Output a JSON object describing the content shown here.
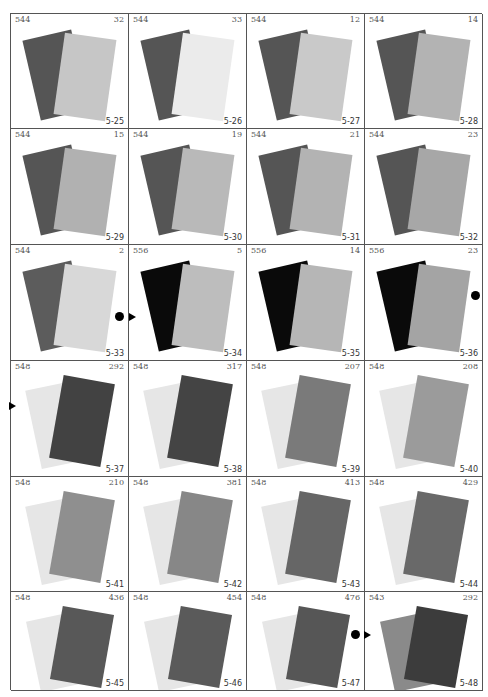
{
  "page": {
    "layout": "4x6 grid of color comparison swatch panels"
  },
  "panels": [
    {
      "code": "544",
      "num": "32",
      "fig": "5-25",
      "back_color": "#555555",
      "front_color": "#c6c6c6"
    },
    {
      "code": "544",
      "num": "33",
      "fig": "5-26",
      "back_color": "#555555",
      "front_color": "#ebebeb"
    },
    {
      "code": "544",
      "num": "12",
      "fig": "5-27",
      "back_color": "#555555",
      "front_color": "#c9c9c9"
    },
    {
      "code": "544",
      "num": "14",
      "fig": "5-28",
      "back_color": "#555555",
      "front_color": "#b3b3b3"
    },
    {
      "code": "544",
      "num": "15",
      "fig": "5-29",
      "back_color": "#555555",
      "front_color": "#b1b1b1"
    },
    {
      "code": "544",
      "num": "19",
      "fig": "5-30",
      "back_color": "#555555",
      "front_color": "#b9b9b9"
    },
    {
      "code": "544",
      "num": "21",
      "fig": "5-31",
      "back_color": "#555555",
      "front_color": "#b3b3b3"
    },
    {
      "code": "544",
      "num": "23",
      "fig": "5-32",
      "back_color": "#555555",
      "front_color": "#a7a7a7"
    },
    {
      "code": "544",
      "num": "2",
      "fig": "5-33",
      "back_color": "#5c5c5c",
      "front_color": "#d8d8d8"
    },
    {
      "code": "556",
      "num": "5",
      "fig": "5-34",
      "back_color": "#0a0a0a",
      "front_color": "#bdbdbd"
    },
    {
      "code": "556",
      "num": "14",
      "fig": "5-35",
      "back_color": "#0a0a0a",
      "front_color": "#b6b6b6"
    },
    {
      "code": "556",
      "num": "23",
      "fig": "5-36",
      "back_color": "#0a0a0a",
      "front_color": "#a4a4a4"
    },
    {
      "code": "548",
      "num": "292",
      "fig": "5-37",
      "back_color": "#e6e6e6",
      "front_color": "#424242"
    },
    {
      "code": "548",
      "num": "317",
      "fig": "5-38",
      "back_color": "#e6e6e6",
      "front_color": "#444444"
    },
    {
      "code": "548",
      "num": "207",
      "fig": "5-39",
      "back_color": "#e6e6e6",
      "front_color": "#7a7a7a"
    },
    {
      "code": "548",
      "num": "208",
      "fig": "5-40",
      "back_color": "#e6e6e6",
      "front_color": "#9b9b9b"
    },
    {
      "code": "548",
      "num": "210",
      "fig": "5-41",
      "back_color": "#e6e6e6",
      "front_color": "#8f8f8f"
    },
    {
      "code": "548",
      "num": "381",
      "fig": "5-42",
      "back_color": "#e6e6e6",
      "front_color": "#878787"
    },
    {
      "code": "548",
      "num": "413",
      "fig": "5-43",
      "back_color": "#e6e6e6",
      "front_color": "#666666"
    },
    {
      "code": "548",
      "num": "429",
      "fig": "5-44",
      "back_color": "#e6e6e6",
      "front_color": "#696969"
    },
    {
      "code": "548",
      "num": "436",
      "fig": "5-45",
      "back_color": "#e6e6e6",
      "front_color": "#585858"
    },
    {
      "code": "548",
      "num": "454",
      "fig": "5-46",
      "back_color": "#e6e6e6",
      "front_color": "#5a5a5a"
    },
    {
      "code": "548",
      "num": "476",
      "fig": "5-47",
      "back_color": "#e6e6e6",
      "front_color": "#565656"
    },
    {
      "code": "543",
      "num": "292",
      "fig": "5-48",
      "back_color": "#8a8a8a",
      "front_color": "#3c3c3c"
    }
  ],
  "markers": [
    {
      "type": "dot",
      "between": "5-33/5-34"
    },
    {
      "type": "triangle",
      "between": "5-33/5-34"
    },
    {
      "type": "dot",
      "at": "5-36 right edge"
    },
    {
      "type": "triangle",
      "at": "5-37 left edge"
    },
    {
      "type": "dot",
      "between": "5-47/5-48"
    },
    {
      "type": "triangle",
      "between": "5-47/5-48"
    }
  ]
}
